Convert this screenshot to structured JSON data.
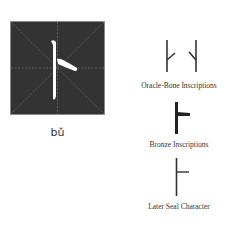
{
  "main_character": {
    "glyph": "卜",
    "pinyin": "bǔ",
    "box_color": "#333333",
    "stroke_color": "#ffffff"
  },
  "script_forms": [
    {
      "label": "Oracle-Bone Inscriptions"
    },
    {
      "label": "Bronze Inscriptions"
    },
    {
      "label": "Later Seal Character"
    }
  ]
}
